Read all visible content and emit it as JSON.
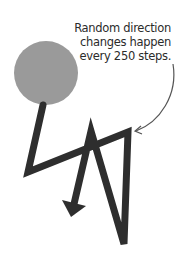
{
  "annotation": {
    "lines": [
      "Random direction",
      "changes happen",
      "every 250 steps."
    ]
  },
  "colors": {
    "circle": "#9a9a9a",
    "path": "#2e2e2e",
    "text": "#2b2b2b"
  },
  "shapes": {
    "circle": {
      "cx": 46,
      "cy": 73,
      "r": 32
    },
    "path_points": [
      [
        43,
        105
      ],
      [
        28,
        172
      ],
      [
        128,
        132
      ],
      [
        124,
        244
      ],
      [
        91,
        131
      ],
      [
        72,
        213
      ]
    ]
  }
}
